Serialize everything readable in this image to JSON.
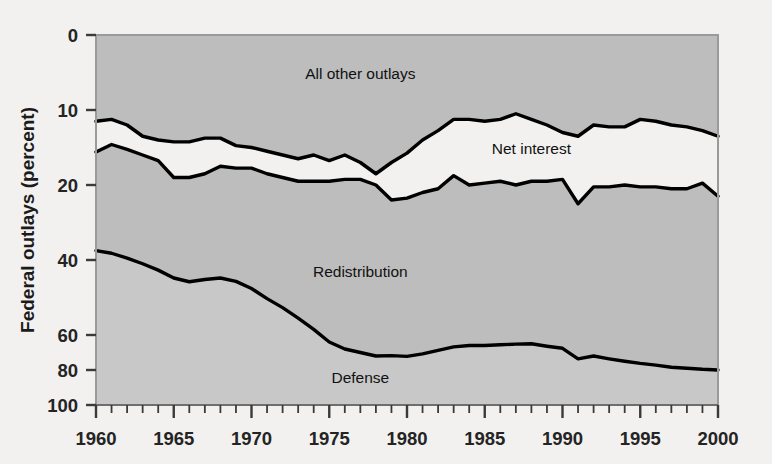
{
  "chart_data": {
    "type": "area",
    "title": "",
    "subtitle": "",
    "xlabel": "",
    "ylabel": "Federal outlays (percent)",
    "xlim": [
      1960,
      2000
    ],
    "ylim": [
      0,
      100
    ],
    "grid": false,
    "legend_position": "inline-annotations",
    "stacked": true,
    "y_axis_note": "piecewise scale: 0-20 expanded, 20-100 compressed",
    "y_ticks": [
      0,
      10,
      20,
      40,
      60,
      80,
      100
    ],
    "x_ticks_major": [
      1960,
      1965,
      1970,
      1975,
      1980,
      1985,
      1990,
      1995,
      2000
    ],
    "x_ticks_minor_step": 1,
    "x": [
      1960,
      1961,
      1962,
      1963,
      1964,
      1965,
      1966,
      1967,
      1968,
      1969,
      1970,
      1971,
      1972,
      1973,
      1974,
      1975,
      1976,
      1977,
      1978,
      1979,
      1980,
      1981,
      1982,
      1983,
      1984,
      1985,
      1986,
      1987,
      1988,
      1989,
      1990,
      1991,
      1992,
      1993,
      1994,
      1995,
      1996,
      1997,
      1998,
      1999,
      2000
    ],
    "series": [
      {
        "name": "Defense",
        "label": "Defense",
        "color": "#c3c3c3",
        "boundary_name": "defense-top-line",
        "values": [
          42.5,
          41.8,
          40.5,
          39.0,
          37.3,
          35.2,
          34.2,
          34.8,
          35.2,
          34.3,
          32.4,
          29.7,
          27.3,
          24.5,
          21.5,
          18.0,
          16.0,
          15.0,
          14.0,
          14.1,
          13.9,
          14.6,
          15.6,
          16.6,
          17.0,
          17.0,
          17.2,
          17.4,
          17.5,
          16.8,
          16.2,
          13.2,
          14.0,
          13.2,
          12.5,
          11.9,
          11.4,
          10.8,
          10.5,
          10.2,
          10.0
        ]
      },
      {
        "name": "Redistribution",
        "label": "Redistribution",
        "color": "#bdbdbd",
        "boundary_name": "redistribution-top-line",
        "cumulative_top": [
          68.8,
          70.8,
          69.5,
          68.0,
          66.5,
          62.0,
          62.0,
          63.0,
          65.0,
          64.5,
          64.5,
          63.0,
          62.0,
          61.0,
          61.0,
          61.0,
          61.5,
          61.5,
          60.0,
          56.0,
          56.5,
          58.0,
          59.0,
          62.5,
          60.0,
          60.5,
          61.0,
          60.0,
          61.0,
          61.0,
          61.5,
          55.0,
          59.5,
          59.5,
          60.0,
          59.5,
          59.5,
          59.0,
          59.0,
          60.5,
          57.0
        ]
      },
      {
        "name": "Net interest",
        "label": "Net interest",
        "color": "#f2f1ef",
        "boundary_name": "net-interest-top-line",
        "cumulative_top": [
          77.0,
          77.5,
          76.0,
          73.0,
          72.0,
          71.5,
          71.5,
          72.5,
          72.5,
          70.5,
          70.0,
          69.0,
          68.0,
          67.0,
          68.0,
          66.5,
          68.0,
          66.0,
          63.0,
          66.0,
          68.5,
          72.0,
          74.5,
          77.5,
          77.5,
          77.0,
          77.5,
          79.0,
          77.5,
          76.0,
          74.0,
          73.0,
          76.0,
          75.5,
          75.5,
          77.5,
          77.0,
          76.0,
          75.5,
          74.5,
          73.0
        ]
      },
      {
        "name": "All other outlays",
        "label": "All other outlays",
        "color": "#bdbdbd",
        "boundary_name": "chart-top-edge",
        "cumulative_top": [
          100,
          100,
          100,
          100,
          100,
          100,
          100,
          100,
          100,
          100,
          100,
          100,
          100,
          100,
          100,
          100,
          100,
          100,
          100,
          100,
          100,
          100,
          100,
          100,
          100,
          100,
          100,
          100,
          100,
          100,
          100,
          100,
          100,
          100,
          100,
          100,
          100,
          100,
          100,
          100,
          100
        ]
      }
    ],
    "annotations": [
      {
        "name": "all-other-outlays-label",
        "text": "All other outlays",
        "x": 1977,
        "y": 90
      },
      {
        "name": "net-interest-label",
        "text": "Net interest",
        "x": 1988,
        "y": 70
      },
      {
        "name": "redistribution-label",
        "text": "Redistribution",
        "x": 1977,
        "y": 37
      },
      {
        "name": "defense-label",
        "text": "Defense",
        "x": 1977,
        "y": 8
      }
    ],
    "colors": {
      "background": "#f2f1ef",
      "plot_band_dark": "#bdbdbd",
      "plot_band_light": "#c8c8c8",
      "line": "#000000",
      "text": "#1b1b1b"
    }
  },
  "axis": {
    "y_title": "Federal outlays (percent)",
    "y_tick_labels": [
      "100",
      "80",
      "60",
      "40",
      "20",
      "10",
      "0"
    ],
    "x_tick_labels": [
      "1960",
      "1965",
      "1970",
      "1975",
      "1980",
      "1985",
      "1990",
      "1995",
      "2000"
    ]
  }
}
